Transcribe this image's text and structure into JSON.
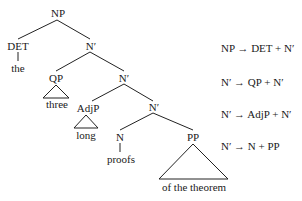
{
  "tree": {
    "nodes": {
      "np": "NP",
      "det": "DET",
      "the": "the",
      "nbar1": "N′",
      "qp": "QP",
      "three": "three",
      "nbar2": "N′",
      "adjp": "AdjP",
      "long": "long",
      "nbar3": "N′",
      "n": "N",
      "proofs": "proofs",
      "pp": "PP",
      "of_the_theorem": "of the theorem"
    }
  },
  "rules": [
    "NP → DET + N′",
    "N′ → QP + N′",
    "N′ → AdjP + N′",
    "N′ → N + PP"
  ]
}
